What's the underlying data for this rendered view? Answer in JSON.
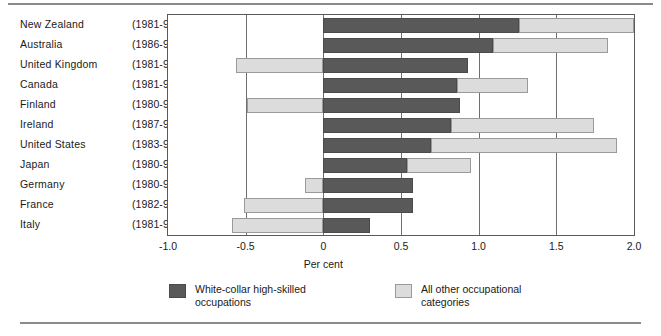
{
  "chart_data": {
    "type": "bar",
    "orientation": "horizontal",
    "stacked": true,
    "title": "",
    "xlabel": "Per cent",
    "ylabel": "",
    "xlim": [
      -1.0,
      2.0
    ],
    "xticks": [
      "-1.0",
      "-0.5",
      "0",
      "0.5",
      "1.0",
      "1.5",
      "2.0"
    ],
    "xtick_values": [
      -1.0,
      -0.5,
      0,
      0.5,
      1.0,
      1.5,
      2.0
    ],
    "grid": true,
    "legend_position": "bottom",
    "categories": [
      "New Zealand",
      "Australia",
      "United Kingdom",
      "Canada",
      "Finland",
      "Ireland",
      "United States",
      "Japan",
      "Germany",
      "France",
      "Italy"
    ],
    "period_labels": [
      "(1981-95)",
      "(1986-91)",
      "(1981-95)",
      "(1981-91)",
      "(1980-90)",
      "(1987-95)",
      "(1983-93)",
      "(1980-90)",
      "(1980-90)",
      "(1982-95)",
      "(1981-95)"
    ],
    "series": [
      {
        "name": "White-collar high-skilled occupations",
        "color": "#595959",
        "values": [
          1.26,
          1.09,
          0.93,
          0.86,
          0.88,
          0.82,
          0.69,
          0.54,
          0.58,
          0.58,
          0.3
        ]
      },
      {
        "name": "All other occupational categories",
        "color": "#dcdcdc",
        "values": [
          0.74,
          0.74,
          -0.56,
          0.46,
          -0.49,
          0.92,
          1.2,
          0.41,
          -0.12,
          -0.51,
          -0.59
        ]
      }
    ],
    "rows": [
      {
        "country": "New Zealand",
        "period": "(1981-95)",
        "dark": 1.26,
        "light_start": 1.26,
        "light_end": 2.0
      },
      {
        "country": "Australia",
        "period": "(1986-91)",
        "dark": 1.09,
        "light_start": 1.09,
        "light_end": 1.83
      },
      {
        "country": "United Kingdom",
        "period": "(1981-95)",
        "dark": 0.93,
        "light_start": -0.56,
        "light_end": 0.0
      },
      {
        "country": "Canada",
        "period": "(1981-91)",
        "dark": 0.86,
        "light_start": 0.86,
        "light_end": 1.32
      },
      {
        "country": "Finland",
        "period": "(1980-90)",
        "dark": 0.88,
        "light_start": -0.49,
        "light_end": 0.0
      },
      {
        "country": "Ireland",
        "period": "(1987-95)",
        "dark": 0.82,
        "light_start": 0.82,
        "light_end": 1.74
      },
      {
        "country": "United States",
        "period": "(1983-93)",
        "dark": 0.69,
        "light_start": 0.69,
        "light_end": 1.89
      },
      {
        "country": "Japan",
        "period": "(1980-90)",
        "dark": 0.54,
        "light_start": 0.54,
        "light_end": 0.95
      },
      {
        "country": "Germany",
        "period": "(1980-90)",
        "dark": 0.58,
        "light_start": -0.12,
        "light_end": 0.0
      },
      {
        "country": "France",
        "period": "(1982-95)",
        "dark": 0.58,
        "light_start": -0.51,
        "light_end": 0.0
      },
      {
        "country": "Italy",
        "period": "(1981-95)",
        "dark": 0.3,
        "light_start": -0.59,
        "light_end": 0.0
      }
    ]
  },
  "axis": {
    "title": "Per cent",
    "ticks": [
      "-1.0",
      "-0.5",
      "0",
      "0.5",
      "1.0",
      "1.5",
      "2.0"
    ]
  },
  "legend": {
    "items": [
      {
        "label": "White-collar high-skilled\noccupations",
        "swatch": "dark"
      },
      {
        "label": "All other occupational\ncategories",
        "swatch": "light"
      }
    ]
  }
}
